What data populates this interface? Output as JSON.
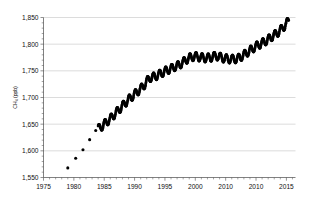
{
  "chart_data": {
    "type": "scatter",
    "title": "",
    "subtitle": "",
    "xlabel": "",
    "ylabel": "CH4 (ppb)",
    "ylabel_display": "CH₄ (ppb)",
    "xlim": [
      1975,
      2016.5
    ],
    "ylim": [
      1550,
      1850
    ],
    "yticks": [
      1550,
      1600,
      1650,
      1700,
      1750,
      1800,
      1850
    ],
    "ytick_labels": [
      "1,550",
      "1,600",
      "1,650",
      "1,700",
      "1,750",
      "1,800",
      "1,850"
    ],
    "xticks": [
      1975,
      1980,
      1985,
      1990,
      1995,
      2000,
      2005,
      2010,
      2015
    ],
    "xtick_labels": [
      "1975",
      "1980",
      "1985",
      "1990",
      "1995",
      "2000",
      "2010",
      "2010",
      "2015"
    ],
    "grid": "horizontal",
    "legend": "none",
    "marker": "filled-circle",
    "marker_color": "#000000",
    "series": [
      {
        "name": "Annual early observations",
        "style": "sparse-points",
        "points": [
          {
            "x": 1979.0,
            "y": 1568
          },
          {
            "x": 1980.3,
            "y": 1586
          },
          {
            "x": 1981.5,
            "y": 1602
          },
          {
            "x": 1982.6,
            "y": 1621
          },
          {
            "x": 1983.6,
            "y": 1638
          }
        ]
      },
      {
        "name": "Monthly mean CH4 with seasonal cycle",
        "style": "dense-sawtooth",
        "seasonal_amplitude": 7.5,
        "points": [
          {
            "x": 1984.0,
            "y": 1641
          },
          {
            "x": 1984.5,
            "y": 1645
          },
          {
            "x": 1985.0,
            "y": 1650
          },
          {
            "x": 1985.5,
            "y": 1655
          },
          {
            "x": 1986.0,
            "y": 1660
          },
          {
            "x": 1986.5,
            "y": 1666
          },
          {
            "x": 1987.0,
            "y": 1672
          },
          {
            "x": 1987.5,
            "y": 1678
          },
          {
            "x": 1988.0,
            "y": 1684
          },
          {
            "x": 1988.5,
            "y": 1690
          },
          {
            "x": 1989.0,
            "y": 1696
          },
          {
            "x": 1989.5,
            "y": 1701
          },
          {
            "x": 1990.0,
            "y": 1706
          },
          {
            "x": 1990.5,
            "y": 1711
          },
          {
            "x": 1991.0,
            "y": 1716
          },
          {
            "x": 1991.5,
            "y": 1722
          },
          {
            "x": 1992.0,
            "y": 1730
          },
          {
            "x": 1992.5,
            "y": 1737
          },
          {
            "x": 1993.0,
            "y": 1738
          },
          {
            "x": 1993.5,
            "y": 1740
          },
          {
            "x": 1994.0,
            "y": 1743
          },
          {
            "x": 1994.5,
            "y": 1746
          },
          {
            "x": 1995.0,
            "y": 1749
          },
          {
            "x": 1995.5,
            "y": 1752
          },
          {
            "x": 1996.0,
            "y": 1754
          },
          {
            "x": 1996.5,
            "y": 1757
          },
          {
            "x": 1997.0,
            "y": 1759
          },
          {
            "x": 1997.5,
            "y": 1762
          },
          {
            "x": 1998.0,
            "y": 1766
          },
          {
            "x": 1998.5,
            "y": 1771
          },
          {
            "x": 1999.0,
            "y": 1774
          },
          {
            "x": 1999.5,
            "y": 1776
          },
          {
            "x": 2000.0,
            "y": 1777
          },
          {
            "x": 2000.5,
            "y": 1776
          },
          {
            "x": 2001.0,
            "y": 1775
          },
          {
            "x": 2001.5,
            "y": 1774
          },
          {
            "x": 2002.0,
            "y": 1774
          },
          {
            "x": 2002.5,
            "y": 1775
          },
          {
            "x": 2003.0,
            "y": 1777
          },
          {
            "x": 2003.5,
            "y": 1778
          },
          {
            "x": 2004.0,
            "y": 1776
          },
          {
            "x": 2004.5,
            "y": 1774
          },
          {
            "x": 2005.0,
            "y": 1773
          },
          {
            "x": 2005.5,
            "y": 1772
          },
          {
            "x": 2006.0,
            "y": 1772
          },
          {
            "x": 2006.5,
            "y": 1772
          },
          {
            "x": 2007.0,
            "y": 1773
          },
          {
            "x": 2007.5,
            "y": 1776
          },
          {
            "x": 2008.0,
            "y": 1780
          },
          {
            "x": 2008.5,
            "y": 1784
          },
          {
            "x": 2009.0,
            "y": 1788
          },
          {
            "x": 2009.5,
            "y": 1792
          },
          {
            "x": 2010.0,
            "y": 1796
          },
          {
            "x": 2010.5,
            "y": 1799
          },
          {
            "x": 2011.0,
            "y": 1802
          },
          {
            "x": 2011.5,
            "y": 1805
          },
          {
            "x": 2012.0,
            "y": 1809
          },
          {
            "x": 2012.5,
            "y": 1813
          },
          {
            "x": 2013.0,
            "y": 1817
          },
          {
            "x": 2013.5,
            "y": 1821
          },
          {
            "x": 2014.0,
            "y": 1826
          },
          {
            "x": 2014.5,
            "y": 1832
          },
          {
            "x": 2015.0,
            "y": 1838
          },
          {
            "x": 2015.4,
            "y": 1845
          }
        ]
      }
    ]
  }
}
